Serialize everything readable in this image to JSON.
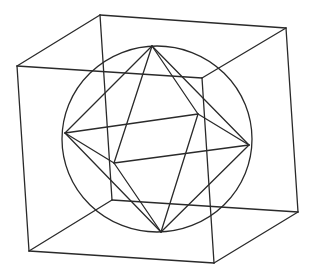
{
  "figure": {
    "stroke_color": "#2a2a2a",
    "background": "#ffffff",
    "stroke_width": 1.3
  },
  "cube": {
    "vertices": {
      "back_top_left": [
        100,
        15
      ],
      "back_top_right": [
        286,
        28
      ],
      "front_top_left": [
        17,
        66
      ],
      "front_top_right": [
        202,
        78
      ],
      "back_bottom_left": [
        112,
        200
      ],
      "back_bottom_right": [
        298,
        212
      ],
      "front_bottom_left": [
        29,
        251
      ],
      "front_bottom_right": [
        214,
        263
      ]
    },
    "edges": [
      [
        "back_top_left",
        "back_top_right"
      ],
      [
        "back_top_left",
        "front_top_left"
      ],
      [
        "back_top_right",
        "front_top_right"
      ],
      [
        "front_top_left",
        "front_top_right"
      ],
      [
        "back_bottom_left",
        "back_bottom_right"
      ],
      [
        "back_bottom_left",
        "front_bottom_left"
      ],
      [
        "back_bottom_right",
        "front_bottom_right"
      ],
      [
        "front_bottom_left",
        "front_bottom_right"
      ],
      [
        "back_top_left",
        "back_bottom_left"
      ],
      [
        "back_top_right",
        "back_bottom_right"
      ],
      [
        "front_top_left",
        "front_bottom_left"
      ],
      [
        "front_top_right",
        "front_bottom_right"
      ]
    ]
  },
  "sphere": {
    "cx": 157,
    "cy": 139,
    "rx": 95,
    "ry": 93
  },
  "octahedron": {
    "vertices": {
      "top": [
        152,
        46
      ],
      "bottom": [
        161,
        232
      ],
      "left": [
        65,
        133
      ],
      "right": [
        249,
        145
      ],
      "back": [
        198,
        114
      ],
      "front": [
        114,
        163
      ]
    },
    "edges": [
      [
        "top",
        "left"
      ],
      [
        "top",
        "right"
      ],
      [
        "top",
        "front"
      ],
      [
        "top",
        "back"
      ],
      [
        "bottom",
        "left"
      ],
      [
        "bottom",
        "right"
      ],
      [
        "bottom",
        "front"
      ],
      [
        "bottom",
        "back"
      ],
      [
        "left",
        "back"
      ],
      [
        "left",
        "front"
      ],
      [
        "right",
        "back"
      ],
      [
        "right",
        "front"
      ]
    ]
  }
}
